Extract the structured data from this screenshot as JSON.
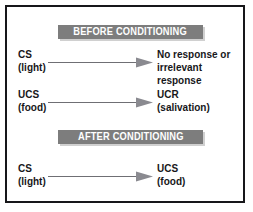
{
  "diagram": {
    "colors": {
      "frame": "#17171a",
      "banner_background": "#7d7d7d",
      "banner_text": "#ffffff",
      "body_text": "#17171a",
      "arrow": "#6f6f74",
      "page_background": "#ffffff"
    },
    "sections": [
      {
        "banner_label": "BEFORE CONDITIONING",
        "rows": [
          {
            "left_term": "CS",
            "left_sub": "(light)",
            "arrow_icon": "right-arrow-icon",
            "right_term": "No response or",
            "right_sub": "irrelevant response"
          },
          {
            "left_term": "UCS",
            "left_sub": "(food)",
            "arrow_icon": "right-arrow-icon",
            "right_term": "UCR",
            "right_sub": "(salivation)"
          }
        ]
      },
      {
        "banner_label": "AFTER CONDITIONING",
        "rows": [
          {
            "left_term": "CS",
            "left_sub": "(light)",
            "arrow_icon": "right-arrow-icon",
            "right_term": "UCS",
            "right_sub": "(food)"
          }
        ]
      }
    ]
  }
}
